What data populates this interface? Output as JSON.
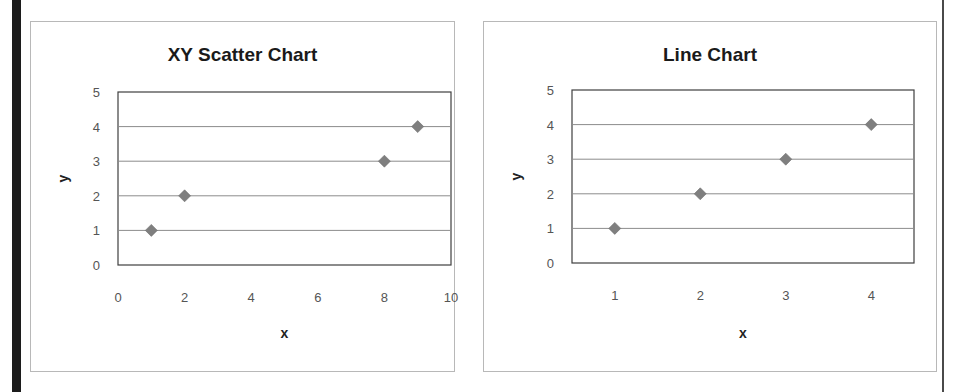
{
  "charts": {
    "scatter": {
      "title": "XY Scatter Chart",
      "xlabel": "x",
      "ylabel": "y",
      "x_ticks": [
        "0",
        "2",
        "4",
        "6",
        "8",
        "10"
      ],
      "y_ticks": [
        "0",
        "1",
        "2",
        "3",
        "4",
        "5"
      ]
    },
    "line": {
      "title": "Line Chart",
      "xlabel": "x",
      "ylabel": "y",
      "x_ticks": [
        "1",
        "2",
        "3",
        "4"
      ],
      "y_ticks": [
        "0",
        "1",
        "2",
        "3",
        "4",
        "5"
      ]
    }
  },
  "colors": {
    "marker": "#7f7f7f",
    "gridline": "#8c8c8c",
    "plot_border": "#3f3f3f",
    "frame_border": "#b8b8b8"
  },
  "chart_data": [
    {
      "type": "scatter",
      "title": "XY Scatter Chart",
      "xlabel": "x",
      "ylabel": "y",
      "x": [
        1,
        2,
        8,
        9
      ],
      "y": [
        1,
        2,
        3,
        4
      ],
      "series": [
        {
          "name": "y",
          "x": [
            1,
            2,
            8,
            9
          ],
          "values": [
            1,
            2,
            3,
            4
          ],
          "marker": "diamond"
        }
      ],
      "xlim": [
        0,
        10
      ],
      "ylim": [
        0,
        5
      ],
      "x_ticks": [
        0,
        2,
        4,
        6,
        8,
        10
      ],
      "y_ticks": [
        0,
        1,
        2,
        3,
        4,
        5
      ],
      "grid": "horizontal major gridlines",
      "legend": "none"
    },
    {
      "type": "line",
      "title": "Line Chart",
      "xlabel": "x",
      "ylabel": "y",
      "categories": [
        "1",
        "2",
        "3",
        "4"
      ],
      "values": [
        1,
        2,
        3,
        4
      ],
      "series": [
        {
          "name": "y",
          "values": [
            1,
            2,
            3,
            4
          ],
          "marker": "diamond",
          "line": "none"
        }
      ],
      "ylim": [
        0,
        5
      ],
      "y_ticks": [
        0,
        1,
        2,
        3,
        4,
        5
      ],
      "grid": "horizontal major gridlines",
      "legend": "none"
    }
  ]
}
